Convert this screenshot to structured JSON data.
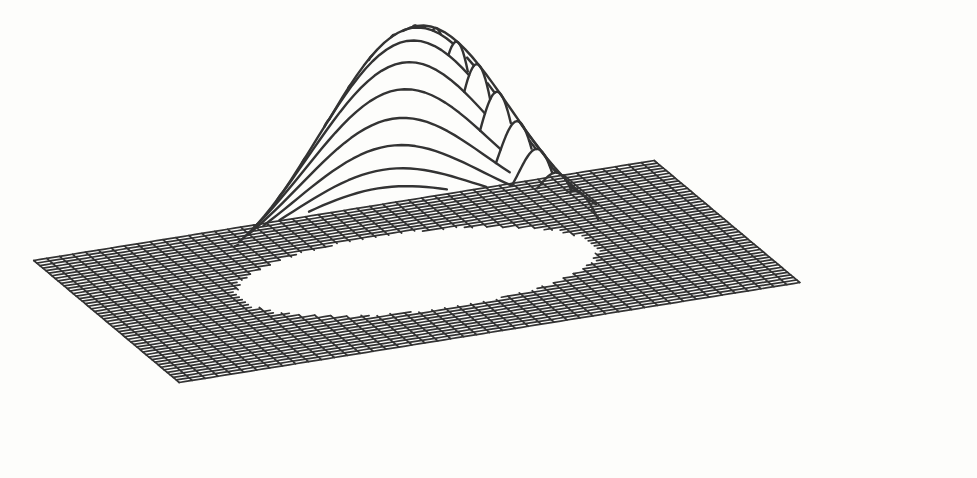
{
  "figure": {
    "kind": "3d-wireframe-surface",
    "title": "",
    "background_color": "#fdfdfb",
    "line_color": "#333333",
    "width_px": 977,
    "height_px": 478
  },
  "chart_data": {
    "type": "surface",
    "title": "",
    "subtitle": "",
    "xlabel": "",
    "ylabel": "",
    "zlabel": "",
    "function": "z = A * exp(-((x^2 + y^2) / (2*s^2)))",
    "amplitude": 1.0,
    "sigma": 0.3,
    "grid": {
      "base_plane_nx": 48,
      "base_plane_ny": 48,
      "peak_mesh_nx": 30,
      "peak_mesh_ny": 30
    },
    "x": [
      -1.0,
      -0.9,
      -0.8,
      -0.7,
      -0.6,
      -0.5,
      -0.4,
      -0.3,
      -0.2,
      -0.1,
      0.0,
      0.1,
      0.2,
      0.3,
      0.4,
      0.5,
      0.6,
      0.7,
      0.8,
      0.9,
      1.0
    ],
    "y": [
      -1.0,
      -0.9,
      -0.8,
      -0.7,
      -0.6,
      -0.5,
      -0.4,
      -0.3,
      -0.2,
      -0.1,
      0.0,
      0.1,
      0.2,
      0.3,
      0.4,
      0.5,
      0.6,
      0.7,
      0.8,
      0.9,
      1.0
    ],
    "z_center_profile": [
      0.0,
      0.0,
      0.0,
      0.0,
      0.004,
      0.062,
      0.249,
      0.606,
      0.895,
      0.995,
      1.0,
      0.995,
      0.895,
      0.606,
      0.249,
      0.062,
      0.004,
      0.0,
      0.0,
      0.0,
      0.0
    ],
    "xlim": [
      -1.0,
      1.0
    ],
    "ylim": [
      -1.0,
      1.0
    ],
    "zlim": [
      0.0,
      1.0
    ],
    "grid_visible": true,
    "legend": null,
    "legend_position": "none",
    "axes_visible": false,
    "tick_labels": [],
    "annotations": [],
    "view": {
      "elevation_deg": 28,
      "azimuth_deg": 45,
      "projection": "orthographic"
    },
    "rendering": {
      "hidden_line_removal": true,
      "shading": "none",
      "stroke_width_peak": 2.4,
      "stroke_width_base": 1.7
    }
  },
  "geometry": {
    "base_corners_px": {
      "left": [
        180,
        221
      ],
      "top": [
        508,
        200
      ],
      "right": [
        946,
        243
      ],
      "bottom": [
        852,
        448
      ],
      "front_left": [
        33,
        422
      ]
    },
    "peak_apex_px": [
      480,
      26
    ],
    "peak_base_left_px": [
      250,
      355
    ],
    "peak_base_right_px": [
      726,
      231
    ]
  }
}
